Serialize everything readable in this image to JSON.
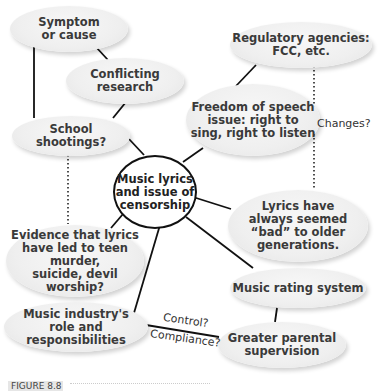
{
  "diagram": {
    "type": "cluster mind map",
    "center": {
      "label": "Music lyrics\nand issue of\ncensorship"
    },
    "nodes": [
      {
        "id": "symptom",
        "label": "Symptom\nor cause"
      },
      {
        "id": "conflicting",
        "label": "Conflicting\nresearch"
      },
      {
        "id": "school",
        "label": "School\nshootings?"
      },
      {
        "id": "evidence",
        "label": "Evidence that lyrics\nhave led to teen murder,\nsuicide, devil worship?"
      },
      {
        "id": "industry",
        "label": "Music industry's\nrole and responsibilities"
      },
      {
        "id": "regulatory",
        "label": "Regulatory agencies:\nFCC, etc."
      },
      {
        "id": "freedom",
        "label": "Freedom of speech\nissue: right to\nsing, right to listen"
      },
      {
        "id": "lyrics_bad",
        "label": "Lyrics have\nalways seemed\n“bad” to older\ngenerations."
      },
      {
        "id": "rating",
        "label": "Music rating system"
      },
      {
        "id": "parental",
        "label": "Greater parental\nsupervision"
      }
    ],
    "edge_labels": {
      "changes": "Changes?",
      "control": "Control?",
      "compliance": "Compliance?"
    },
    "edges": [
      {
        "from": "symptom",
        "to": "school",
        "style": "solid"
      },
      {
        "from": "symptom",
        "to": "conflicting",
        "style": "solid"
      },
      {
        "from": "conflicting",
        "to": "school",
        "style": "solid"
      },
      {
        "from": "school",
        "to": "center",
        "style": "solid"
      },
      {
        "from": "school",
        "to": "evidence",
        "style": "dotted"
      },
      {
        "from": "center",
        "to": "evidence",
        "style": "solid"
      },
      {
        "from": "center",
        "to": "industry",
        "style": "solid"
      },
      {
        "from": "center",
        "to": "freedom",
        "style": "solid"
      },
      {
        "from": "freedom",
        "to": "regulatory",
        "style": "solid"
      },
      {
        "from": "regulatory",
        "to": "lyrics_bad",
        "style": "dotted",
        "label": "Changes?"
      },
      {
        "from": "center",
        "to": "lyrics_bad",
        "style": "solid"
      },
      {
        "from": "center",
        "to": "rating",
        "style": "solid"
      },
      {
        "from": "rating",
        "to": "parental",
        "style": "solid"
      },
      {
        "from": "industry",
        "to": "parental",
        "style": "solid",
        "label": "Control? / Compliance?"
      }
    ]
  },
  "caption": {
    "label": "FIGURE 8.8"
  }
}
